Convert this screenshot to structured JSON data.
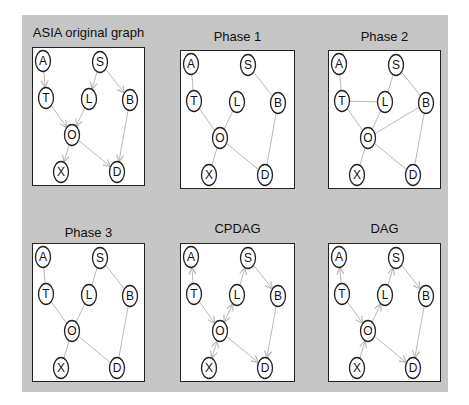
{
  "figure": {
    "background_color": "#c6c6c6",
    "box_color": "#ffffff",
    "edge_color": "#b8b8b8",
    "node_stroke": "#222222"
  },
  "nodes": [
    {
      "id": "A",
      "x": 10,
      "y": 13
    },
    {
      "id": "S",
      "x": 67,
      "y": 14
    },
    {
      "id": "T",
      "x": 13,
      "y": 50
    },
    {
      "id": "L",
      "x": 56,
      "y": 51
    },
    {
      "id": "B",
      "x": 97,
      "y": 52
    },
    {
      "id": "O",
      "x": 39,
      "y": 87
    },
    {
      "id": "X",
      "x": 28,
      "y": 124
    },
    {
      "id": "D",
      "x": 84,
      "y": 124
    }
  ],
  "panels": [
    {
      "title": "ASIA original graph",
      "left": 10,
      "top": 0,
      "title_top": 10,
      "box_top": 32,
      "width": 113,
      "edges": [
        {
          "from": "A",
          "to": "T",
          "type": "directed"
        },
        {
          "from": "S",
          "to": "L",
          "type": "directed"
        },
        {
          "from": "S",
          "to": "B",
          "type": "directed"
        },
        {
          "from": "T",
          "to": "O",
          "type": "directed"
        },
        {
          "from": "L",
          "to": "O",
          "type": "directed"
        },
        {
          "from": "B",
          "to": "D",
          "type": "directed"
        },
        {
          "from": "O",
          "to": "X",
          "type": "directed"
        },
        {
          "from": "O",
          "to": "D",
          "type": "directed"
        }
      ]
    },
    {
      "title": "Phase 1",
      "left": 158,
      "top": 0,
      "title_top": 14,
      "box_top": 35,
      "width": 115,
      "edges": [
        {
          "from": "A",
          "to": "T",
          "type": "undirected"
        },
        {
          "from": "S",
          "to": "B",
          "type": "undirected"
        },
        {
          "from": "T",
          "to": "O",
          "type": "undirected"
        },
        {
          "from": "L",
          "to": "O",
          "type": "undirected"
        },
        {
          "from": "B",
          "to": "D",
          "type": "undirected"
        },
        {
          "from": "O",
          "to": "X",
          "type": "undirected"
        },
        {
          "from": "O",
          "to": "D",
          "type": "undirected"
        }
      ]
    },
    {
      "title": "Phase 2",
      "left": 306,
      "top": 0,
      "title_top": 14,
      "box_top": 35,
      "width": 113,
      "edges": [
        {
          "from": "A",
          "to": "T",
          "type": "undirected"
        },
        {
          "from": "S",
          "to": "L",
          "type": "undirected"
        },
        {
          "from": "S",
          "to": "B",
          "type": "undirected"
        },
        {
          "from": "T",
          "to": "L",
          "type": "undirected"
        },
        {
          "from": "T",
          "to": "O",
          "type": "undirected"
        },
        {
          "from": "L",
          "to": "O",
          "type": "undirected"
        },
        {
          "from": "O",
          "to": "B",
          "type": "undirected"
        },
        {
          "from": "B",
          "to": "D",
          "type": "undirected"
        },
        {
          "from": "O",
          "to": "X",
          "type": "undirected"
        },
        {
          "from": "O",
          "to": "D",
          "type": "undirected"
        }
      ]
    },
    {
      "title": "Phase 3",
      "left": 10,
      "top": 196,
      "title_top": 14,
      "box_top": 32,
      "width": 113,
      "edges": [
        {
          "from": "A",
          "to": "T",
          "type": "undirected"
        },
        {
          "from": "S",
          "to": "L",
          "type": "undirected"
        },
        {
          "from": "S",
          "to": "B",
          "type": "undirected"
        },
        {
          "from": "T",
          "to": "O",
          "type": "undirected"
        },
        {
          "from": "L",
          "to": "O",
          "type": "undirected"
        },
        {
          "from": "B",
          "to": "D",
          "type": "undirected"
        },
        {
          "from": "O",
          "to": "X",
          "type": "undirected"
        },
        {
          "from": "O",
          "to": "D",
          "type": "undirected"
        }
      ]
    },
    {
      "title": "CPDAG",
      "left": 158,
      "top": 196,
      "title_top": 10,
      "box_top": 32,
      "width": 115,
      "edges": [
        {
          "from": "T",
          "to": "A",
          "type": "directed"
        },
        {
          "from": "L",
          "to": "S",
          "type": "directed"
        },
        {
          "from": "S",
          "to": "B",
          "type": "directed"
        },
        {
          "from": "T",
          "to": "O",
          "type": "directed"
        },
        {
          "from": "L",
          "to": "O",
          "type": "bidirected"
        },
        {
          "from": "B",
          "to": "D",
          "type": "directed"
        },
        {
          "from": "O",
          "to": "X",
          "type": "bidirected"
        },
        {
          "from": "O",
          "to": "D",
          "type": "directed"
        }
      ]
    },
    {
      "title": "DAG",
      "left": 306,
      "top": 196,
      "title_top": 10,
      "box_top": 32,
      "width": 113,
      "edges": [
        {
          "from": "T",
          "to": "A",
          "type": "directed"
        },
        {
          "from": "L",
          "to": "S",
          "type": "directed"
        },
        {
          "from": "S",
          "to": "B",
          "type": "directed"
        },
        {
          "from": "T",
          "to": "O",
          "type": "directed"
        },
        {
          "from": "O",
          "to": "L",
          "type": "directed"
        },
        {
          "from": "B",
          "to": "D",
          "type": "directed"
        },
        {
          "from": "X",
          "to": "O",
          "type": "directed"
        },
        {
          "from": "O",
          "to": "D",
          "type": "directed"
        }
      ]
    }
  ]
}
